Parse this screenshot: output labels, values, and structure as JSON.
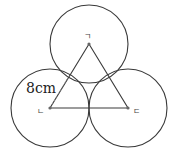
{
  "diagram": {
    "stroke_color": "#3a3a3a",
    "dashed_color": "#888888",
    "circles": [
      {
        "id": "top",
        "cx": 89,
        "cy": 44,
        "r": 39
      },
      {
        "id": "left",
        "cx": 50,
        "cy": 108,
        "r": 39
      },
      {
        "id": "right",
        "cx": 128,
        "cy": 108,
        "r": 39
      }
    ],
    "points": [
      {
        "label": "ㄱ",
        "x": 89,
        "y": 44
      },
      {
        "label": "ㄴ",
        "x": 50,
        "y": 108
      },
      {
        "label": "ㄷ",
        "x": 128,
        "y": 108
      }
    ],
    "radius_label": "8cm"
  }
}
